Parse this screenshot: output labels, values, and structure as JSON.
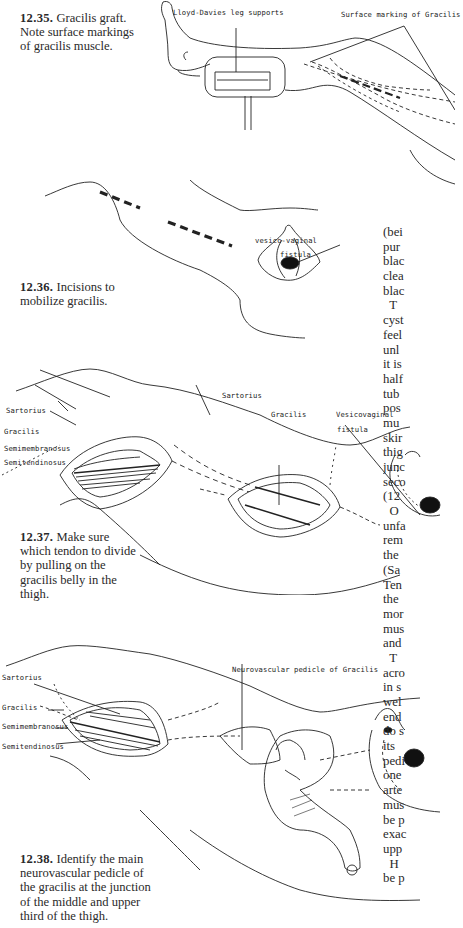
{
  "figures": [
    {
      "number": "12.35.",
      "caption": "Gracilis graft. Note surface markings of gracilis muscle.",
      "caption_lines": [
        "Gracilis graft.",
        "Note surface markings",
        "of gracilis muscle."
      ],
      "labels": {
        "leg_supports": "Lloyd-Davies leg supports",
        "surface_marking": "Surface marking of Gracilis"
      }
    },
    {
      "number": "12.36.",
      "caption": "Incisions to mobilize gracilis.",
      "caption_lines": [
        "Incisions to",
        "mobilize gracilis."
      ],
      "labels": {
        "fistula_line1": "vesico-vaginal",
        "fistula_line2": "fistula"
      }
    },
    {
      "number": "12.37.",
      "caption": "Make sure which tendon to divide by pulling on the gracilis belly in the thigh.",
      "caption_lines": [
        "Make sure",
        "which tendon to",
        "divide by pulling on",
        "the gracilis belly in",
        "the thigh."
      ],
      "labels": {
        "sartorius": "Sartorius",
        "gracilis": "Gracilis",
        "semimembranosus": "Semimembranosus",
        "semitendinosus": "Semitendinosus",
        "sartorius_mid": "Sartorius",
        "gracilis_mid": "Gracilis",
        "vesicovaginal_line1": "Vesicovaginal",
        "vesicovaginal_line2": "fistula"
      }
    },
    {
      "number": "12.38.",
      "caption": "Identify the main neurovascular pedicle of the gracilis at the junction of the middle and upper third of the thigh.",
      "caption_lines": [
        "Identify the",
        "main neurovascular",
        "pedicle of the gracilis",
        "at the junction of the",
        "middle and upper",
        "third of the thigh."
      ],
      "labels": {
        "sartorius": "Sartorius",
        "gracilis": "Gracilis",
        "semimembranosus": "Semimembranosus",
        "semitendinosus": "Semitendinosus",
        "pedicle": "Neurovascular pedicle of Gracilis"
      }
    }
  ],
  "body_text_column": {
    "lines": [
      "(bei",
      "pur",
      "blac",
      "clea",
      "blac",
      "  T",
      "cyst",
      "feel",
      "unl",
      "it is",
      "half",
      "tub",
      "pos",
      "mu",
      "skir",
      "thig",
      "junc",
      "seco",
      "(12",
      "  O",
      "unfa",
      "rem",
      "the",
      "(Sa",
      "Ten",
      "the",
      "mor",
      "mus",
      "and",
      "  T",
      "acro",
      "in s",
      "wel",
      "end",
      "do s",
      "its",
      "pedi",
      "one",
      "arte",
      "mus",
      "be p",
      "exac",
      "upp",
      "  H",
      "be p"
    ]
  }
}
